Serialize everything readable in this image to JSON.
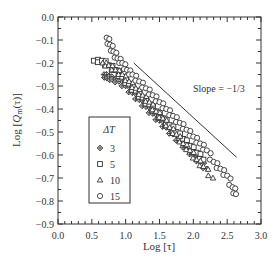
{
  "chart_data": {
    "type": "scatter",
    "title": "",
    "xlabel": "Log [τ]",
    "ylabel": "Log [Q_m(τ)]",
    "xlim": [
      0.0,
      3.0
    ],
    "ylim": [
      -0.9,
      0.0
    ],
    "xticks": [
      "0.0",
      "0.5",
      "1.0",
      "1.5",
      "2.0",
      "2.5",
      "3.0"
    ],
    "yticks": [
      "0.0",
      "−0.1",
      "−0.2",
      "−0.3",
      "−0.4",
      "−0.5",
      "−0.6",
      "−0.7",
      "−0.8",
      "−0.9"
    ],
    "grid": false,
    "legend": {
      "title": "ΔT",
      "position": "lower-left-inside",
      "entries": [
        {
          "label": "3",
          "marker": "diamond-crossed"
        },
        {
          "label": "5",
          "marker": "square"
        },
        {
          "label": "10",
          "marker": "triangle"
        },
        {
          "label": "15",
          "marker": "circle"
        }
      ]
    },
    "annotation": {
      "text": "Slope = −1/3",
      "reference_line": {
        "x": [
          1.12,
          2.64
        ],
        "y": [
          -0.2,
          -0.61
        ]
      }
    },
    "series": [
      {
        "name": "3",
        "marker": "diamond-crossed",
        "x": [
          0.68,
          0.72,
          0.76,
          0.8,
          0.9,
          1.0,
          1.1,
          1.2,
          1.3,
          1.4,
          1.5,
          1.6,
          1.7,
          1.8,
          1.9,
          2.0,
          2.1,
          2.2
        ],
        "y": [
          -0.25,
          -0.26,
          -0.26,
          -0.27,
          -0.28,
          -0.3,
          -0.33,
          -0.36,
          -0.39,
          -0.42,
          -0.45,
          -0.48,
          -0.51,
          -0.54,
          -0.57,
          -0.6,
          -0.63,
          -0.66
        ]
      },
      {
        "name": "5",
        "marker": "square",
        "x": [
          0.53,
          0.65,
          0.75,
          0.85,
          0.95,
          1.05,
          1.15,
          1.25,
          1.35,
          1.45,
          1.55,
          1.65,
          1.75,
          1.85,
          1.95,
          2.05,
          2.15
        ],
        "y": [
          -0.19,
          -0.19,
          -0.21,
          -0.23,
          -0.26,
          -0.29,
          -0.32,
          -0.35,
          -0.38,
          -0.41,
          -0.44,
          -0.47,
          -0.5,
          -0.53,
          -0.56,
          -0.59,
          -0.62
        ]
      },
      {
        "name": "10",
        "marker": "triangle",
        "x": [
          0.66,
          0.75,
          0.85,
          0.95,
          1.05,
          1.15,
          1.25,
          1.35,
          1.45,
          1.55,
          1.65,
          1.75,
          1.85,
          1.95,
          2.05,
          2.15,
          2.29
        ],
        "y": [
          -0.2,
          -0.21,
          -0.23,
          -0.25,
          -0.28,
          -0.31,
          -0.34,
          -0.37,
          -0.41,
          -0.44,
          -0.48,
          -0.51,
          -0.55,
          -0.58,
          -0.62,
          -0.65,
          -0.7
        ]
      },
      {
        "name": "15",
        "marker": "circle",
        "x": [
          0.72,
          0.77,
          0.82,
          0.88,
          0.95,
          1.02,
          1.1,
          1.2,
          1.3,
          1.4,
          1.5,
          1.6,
          1.7,
          1.8,
          1.9,
          2.0,
          2.1,
          2.2,
          2.3,
          2.4,
          2.5,
          2.58,
          2.63
        ],
        "y": [
          -0.09,
          -0.12,
          -0.15,
          -0.18,
          -0.2,
          -0.23,
          -0.25,
          -0.28,
          -0.31,
          -0.34,
          -0.37,
          -0.4,
          -0.43,
          -0.46,
          -0.49,
          -0.52,
          -0.55,
          -0.58,
          -0.63,
          -0.66,
          -0.69,
          -0.74,
          -0.77
        ]
      }
    ]
  }
}
